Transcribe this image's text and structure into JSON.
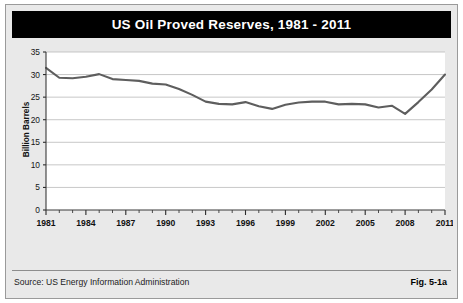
{
  "figure": {
    "title": "US Oil Proved Reserves, 1981 - 2011",
    "source": "Source: US Energy Information Administration",
    "figure_number": "Fig. 5-1a",
    "title_bar_color": "#000000",
    "panel_color": "#e9e9e9",
    "line_color": "#5e5e5e"
  },
  "chart_data": {
    "type": "line",
    "title": "US Oil Proved Reserves, 1981 - 2011",
    "xlabel": "",
    "ylabel": "Billion Barrels",
    "xlim": [
      1981,
      2011
    ],
    "ylim": [
      0,
      35
    ],
    "grid": true,
    "legend": null,
    "ytick_labels": [
      "0",
      "5",
      "10",
      "15",
      "20",
      "25",
      "30",
      "35"
    ],
    "yticks": [
      0,
      5,
      10,
      15,
      20,
      25,
      30,
      35
    ],
    "xtick_labels": [
      "1981",
      "1984",
      "1987",
      "1990",
      "1993",
      "1996",
      "1999",
      "2002",
      "2005",
      "2008",
      "2011"
    ],
    "xticks": [
      1981,
      1984,
      1987,
      1990,
      1993,
      1996,
      1999,
      2002,
      2005,
      2008,
      2011
    ],
    "x": [
      1981,
      1982,
      1983,
      1984,
      1985,
      1986,
      1987,
      1988,
      1989,
      1990,
      1991,
      1992,
      1993,
      1994,
      1995,
      1996,
      1997,
      1998,
      1999,
      2000,
      2001,
      2002,
      2003,
      2004,
      2005,
      2006,
      2007,
      2008,
      2009,
      2010,
      2011
    ],
    "values": [
      31.5,
      29.3,
      29.2,
      29.5,
      30.1,
      29.0,
      28.8,
      28.6,
      28.0,
      27.8,
      26.8,
      25.5,
      24.0,
      23.5,
      23.4,
      23.9,
      23.0,
      22.4,
      23.3,
      23.8,
      24.0,
      24.0,
      23.4,
      23.5,
      23.4,
      22.7,
      23.1,
      21.3,
      23.9,
      26.7,
      30.0
    ],
    "series": [
      {
        "name": "US Oil Proved Reserves",
        "units": "Billion Barrels",
        "values": [
          31.5,
          29.3,
          29.2,
          29.5,
          30.1,
          29.0,
          28.8,
          28.6,
          28.0,
          27.8,
          26.8,
          25.5,
          24.0,
          23.5,
          23.4,
          23.9,
          23.0,
          22.4,
          23.3,
          23.8,
          24.0,
          24.0,
          23.4,
          23.5,
          23.4,
          22.7,
          23.1,
          21.3,
          23.9,
          26.7,
          30.0
        ]
      }
    ]
  }
}
